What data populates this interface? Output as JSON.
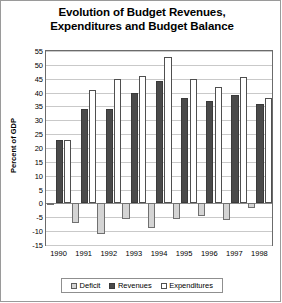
{
  "chart_data": {
    "type": "bar",
    "title": "Evolution of Budget Revenues, Expenditures and Budget Balance",
    "title_line1": "Evolution of Budget Revenues,",
    "title_line2": "Expenditures and Budget Balance",
    "xlabel": "",
    "ylabel": "Percent of GDP",
    "categories": [
      "1990",
      "1991",
      "1992",
      "1993",
      "1994",
      "1995",
      "1996",
      "1997",
      "1998"
    ],
    "ylim": [
      -15,
      55
    ],
    "yticks": [
      55,
      50,
      45,
      40,
      35,
      30,
      25,
      20,
      15,
      10,
      5,
      0,
      -5,
      -10,
      -15
    ],
    "grid": true,
    "legend_position": "bottom",
    "series": [
      {
        "name": "Deficit",
        "color": "#d4d4d4",
        "values": [
          -0.5,
          -7.0,
          -11.0,
          -5.5,
          -9.0,
          -5.5,
          -4.5,
          -6.0,
          -1.5
        ]
      },
      {
        "name": "Revenues",
        "color": "#4a4a4a",
        "values": [
          23.0,
          34.0,
          34.0,
          40.0,
          44.0,
          38.0,
          37.0,
          39.0,
          36.0
        ]
      },
      {
        "name": "Expenditures",
        "color": "#ffffff",
        "values": [
          23.0,
          41.0,
          45.0,
          46.0,
          53.0,
          45.0,
          42.0,
          45.5,
          38.0
        ]
      }
    ]
  },
  "legend": {
    "items": [
      {
        "label": "Deficit",
        "swatch": "deficit"
      },
      {
        "label": "Revenues",
        "swatch": "revenues"
      },
      {
        "label": "Expenditures",
        "swatch": "expenditures"
      }
    ]
  }
}
